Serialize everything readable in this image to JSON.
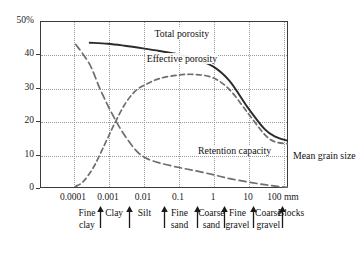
{
  "chart_data": {
    "type": "line",
    "title": "",
    "xlabel": "Mean grain size",
    "ylabel": "",
    "xscale": "log",
    "xlim": [
      3e-05,
      250
    ],
    "ylim": [
      0,
      50
    ],
    "grid": true,
    "x_unit": "mm",
    "y_unit": "%",
    "xticks": [
      {
        "value": 0.0001,
        "label": "0.0001"
      },
      {
        "value": 0.001,
        "label": "0.001"
      },
      {
        "value": 0.01,
        "label": "0.01"
      },
      {
        "value": 0.1,
        "label": "0.1"
      },
      {
        "value": 1,
        "label": "1"
      },
      {
        "value": 10,
        "label": "10"
      },
      {
        "value": 100,
        "label": "100 mm"
      }
    ],
    "yticks": [
      {
        "value": 50,
        "label": "50%"
      },
      {
        "value": 40,
        "label": "40"
      },
      {
        "value": 30,
        "label": "30"
      },
      {
        "value": 20,
        "label": "20"
      },
      {
        "value": 10,
        "label": "10"
      },
      {
        "value": 0,
        "label": "0"
      }
    ],
    "series": [
      {
        "name": "Total porosity",
        "style": "solid",
        "color": "#2b2b2b",
        "label_x": 0.02,
        "label_y": 46,
        "points": [
          {
            "x": 0.0003,
            "y": 43.5
          },
          {
            "x": 0.001,
            "y": 43.2
          },
          {
            "x": 0.003,
            "y": 42.6
          },
          {
            "x": 0.01,
            "y": 41.8
          },
          {
            "x": 0.03,
            "y": 41.0
          },
          {
            "x": 0.1,
            "y": 40.0
          },
          {
            "x": 0.3,
            "y": 38.6
          },
          {
            "x": 1,
            "y": 36.4
          },
          {
            "x": 3,
            "y": 32.0
          },
          {
            "x": 10,
            "y": 24.0
          },
          {
            "x": 30,
            "y": 17.6
          },
          {
            "x": 60,
            "y": 15.4
          },
          {
            "x": 150,
            "y": 14.0
          }
        ]
      },
      {
        "name": "Effective porosity",
        "style": "dashed",
        "color": "#6e6e6e",
        "label_x": 0.012,
        "label_y": 38.5,
        "points": [
          {
            "x": 0.00012,
            "y": 0.5
          },
          {
            "x": 0.0002,
            "y": 2.0
          },
          {
            "x": 0.0004,
            "y": 6.5
          },
          {
            "x": 0.0008,
            "y": 13.0
          },
          {
            "x": 0.0015,
            "y": 19.0
          },
          {
            "x": 0.003,
            "y": 25.0
          },
          {
            "x": 0.006,
            "y": 29.0
          },
          {
            "x": 0.012,
            "y": 31.0
          },
          {
            "x": 0.03,
            "y": 32.8
          },
          {
            "x": 0.1,
            "y": 33.8
          },
          {
            "x": 0.3,
            "y": 34.0
          },
          {
            "x": 1,
            "y": 33.0
          },
          {
            "x": 3,
            "y": 29.4
          },
          {
            "x": 10,
            "y": 22.4
          },
          {
            "x": 30,
            "y": 16.0
          },
          {
            "x": 60,
            "y": 13.8
          },
          {
            "x": 150,
            "y": 13.2
          }
        ]
      },
      {
        "name": "Retention capacity",
        "style": "dashed",
        "color": "#6e6e6e",
        "label_x": 0.35,
        "label_y": 11.2,
        "points": [
          {
            "x": 0.00012,
            "y": 43.0
          },
          {
            "x": 0.0003,
            "y": 37.0
          },
          {
            "x": 0.0006,
            "y": 29.5
          },
          {
            "x": 0.0012,
            "y": 23.0
          },
          {
            "x": 0.0025,
            "y": 17.0
          },
          {
            "x": 0.006,
            "y": 11.5
          },
          {
            "x": 0.012,
            "y": 9.0
          },
          {
            "x": 0.03,
            "y": 7.5
          },
          {
            "x": 0.1,
            "y": 6.2
          },
          {
            "x": 0.3,
            "y": 5.2
          },
          {
            "x": 1,
            "y": 4.0
          },
          {
            "x": 3,
            "y": 2.8
          },
          {
            "x": 10,
            "y": 1.8
          },
          {
            "x": 30,
            "y": 1.0
          },
          {
            "x": 80,
            "y": 0.4
          },
          {
            "x": 150,
            "y": 0.2
          }
        ]
      }
    ],
    "annotations": [
      {
        "name": "mean-grain-size",
        "text_line1": "Mean grain",
        "text_line2": "size"
      }
    ],
    "categories": [
      {
        "label_line1": "Fine",
        "label_line2": "clay",
        "center_x": 0.00025,
        "boundary_right": 0.0006
      },
      {
        "label_line1": "Clay",
        "label_line2": "",
        "center_x": 0.0015,
        "boundary_right": 0.004
      },
      {
        "label_line1": "Silt",
        "label_line2": "",
        "center_x": 0.011,
        "boundary_right": 0.04
      },
      {
        "label_line1": "Fine",
        "label_line2": "sand",
        "center_x": 0.11,
        "boundary_right": 0.35
      },
      {
        "label_line1": "Coarse",
        "label_line2": "sand",
        "center_x": 0.9,
        "boundary_right": 2.2
      },
      {
        "label_line1": "Fine",
        "label_line2": "gravel",
        "center_x": 5.0,
        "boundary_right": 14
      },
      {
        "label_line1": "Coarse",
        "label_line2": "gravel",
        "center_x": 38,
        "boundary_right": 95
      },
      {
        "label_line1": "Blocks",
        "label_line2": "",
        "center_x": 170,
        "boundary_right": null
      }
    ]
  }
}
